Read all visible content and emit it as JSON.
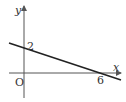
{
  "diagram": {
    "type": "coordinate-plane-line",
    "axes": {
      "x_label": "x",
      "y_label": "y",
      "origin_label": "O"
    },
    "line": {
      "y_intercept": 2,
      "x_intercept": 6
    },
    "labels": {
      "y_intercept": "2",
      "x_intercept": "6"
    },
    "colors": {
      "axis": "#555555",
      "line": "#222222",
      "text": "#333333"
    }
  }
}
